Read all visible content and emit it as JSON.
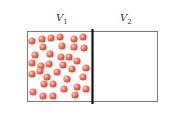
{
  "diagram": {
    "left_label": {
      "symbol": "V",
      "subscript": "1"
    },
    "right_label": {
      "symbol": "V",
      "subscript": "2"
    },
    "colors": {
      "particle": "#e8503f",
      "particle_highlight": "#ffd0c4",
      "border": "#7a7a7a",
      "divider": "#111111"
    },
    "particles": [
      [
        32,
        41
      ],
      [
        42,
        39
      ],
      [
        51,
        38
      ],
      [
        60,
        37
      ],
      [
        74,
        39
      ],
      [
        83,
        37
      ],
      [
        43,
        47
      ],
      [
        62,
        46
      ],
      [
        74,
        47
      ],
      [
        84,
        48
      ],
      [
        35,
        55
      ],
      [
        50,
        54
      ],
      [
        61,
        57
      ],
      [
        69,
        57
      ],
      [
        77,
        61
      ],
      [
        32,
        63
      ],
      [
        41,
        66
      ],
      [
        49,
        64
      ],
      [
        63,
        65
      ],
      [
        72,
        69
      ],
      [
        86,
        68
      ],
      [
        32,
        74
      ],
      [
        40,
        71
      ],
      [
        47,
        77
      ],
      [
        57,
        72
      ],
      [
        67,
        79
      ],
      [
        83,
        77
      ],
      [
        44,
        84
      ],
      [
        53,
        84
      ],
      [
        64,
        89
      ],
      [
        77,
        87
      ],
      [
        86,
        89
      ],
      [
        33,
        92
      ],
      [
        43,
        96
      ],
      [
        53,
        96
      ],
      [
        75,
        95
      ]
    ]
  }
}
